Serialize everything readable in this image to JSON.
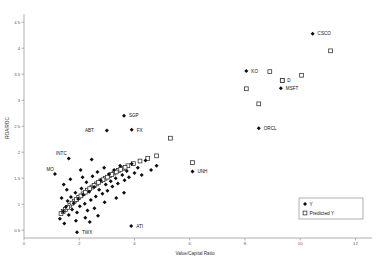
{
  "chart_data": {
    "type": "scatter",
    "title": "",
    "xlabel": "Value/Capital Ratio",
    "ylabel": "ROA/ROC",
    "xlim": [
      0,
      12.6
    ],
    "ylim": [
      0.35,
      4.62
    ],
    "xticks": [
      0,
      2,
      4,
      6,
      8,
      10,
      12
    ],
    "yticks": [
      0.5,
      1,
      1.5,
      2,
      2.5,
      3,
      3.5,
      4,
      4.5
    ],
    "grid": false,
    "legend_position": "bottom-right",
    "legend": [
      {
        "name": "Y",
        "marker": "filled-diamond",
        "color": "#0d0d0d"
      },
      {
        "name": "Predicted Y",
        "marker": "open-square",
        "color": "#2b2b2b"
      }
    ],
    "series": [
      {
        "name": "Y",
        "marker": "filled-diamond",
        "points": [
          {
            "x": 1.3,
            "y": 0.72
          },
          {
            "x": 1.42,
            "y": 0.86
          },
          {
            "x": 1.46,
            "y": 0.63
          },
          {
            "x": 1.52,
            "y": 0.95
          },
          {
            "x": 1.58,
            "y": 1.06
          },
          {
            "x": 1.62,
            "y": 0.79
          },
          {
            "x": 1.7,
            "y": 1.14
          },
          {
            "x": 1.74,
            "y": 0.9
          },
          {
            "x": 1.8,
            "y": 1.02
          },
          {
            "x": 1.86,
            "y": 1.22
          },
          {
            "x": 1.92,
            "y": 0.84
          },
          {
            "x": 1.96,
            "y": 1.1
          },
          {
            "x": 2.02,
            "y": 0.96
          },
          {
            "x": 2.08,
            "y": 1.3
          },
          {
            "x": 2.14,
            "y": 1.18
          },
          {
            "x": 2.2,
            "y": 1.01
          },
          {
            "x": 2.26,
            "y": 1.42
          },
          {
            "x": 2.3,
            "y": 0.88
          },
          {
            "x": 2.36,
            "y": 1.24
          },
          {
            "x": 2.42,
            "y": 1.08
          },
          {
            "x": 2.48,
            "y": 1.54
          },
          {
            "x": 2.54,
            "y": 1.33
          },
          {
            "x": 2.6,
            "y": 1.15
          },
          {
            "x": 2.66,
            "y": 1.62
          },
          {
            "x": 2.72,
            "y": 1.28
          },
          {
            "x": 2.78,
            "y": 1.46
          },
          {
            "x": 2.84,
            "y": 1.2
          },
          {
            "x": 2.9,
            "y": 1.7
          },
          {
            "x": 2.96,
            "y": 1.38
          },
          {
            "x": 3.02,
            "y": 1.26
          },
          {
            "x": 3.08,
            "y": 1.58
          },
          {
            "x": 3.14,
            "y": 1.44
          },
          {
            "x": 3.2,
            "y": 1.34
          },
          {
            "x": 3.26,
            "y": 1.66
          },
          {
            "x": 3.32,
            "y": 1.5
          },
          {
            "x": 3.4,
            "y": 1.4
          },
          {
            "x": 3.48,
            "y": 1.74
          },
          {
            "x": 3.56,
            "y": 1.56
          },
          {
            "x": 3.64,
            "y": 1.46
          },
          {
            "x": 3.72,
            "y": 1.64
          },
          {
            "x": 3.8,
            "y": 1.52
          },
          {
            "x": 3.9,
            "y": 1.78
          },
          {
            "x": 4.0,
            "y": 1.6
          },
          {
            "x": 4.12,
            "y": 1.7
          },
          {
            "x": 4.26,
            "y": 1.56
          },
          {
            "x": 4.4,
            "y": 1.84
          },
          {
            "x": 4.6,
            "y": 1.66
          },
          {
            "x": 4.8,
            "y": 1.74
          },
          {
            "x": 1.36,
            "y": 1.12
          },
          {
            "x": 1.55,
            "y": 1.28
          },
          {
            "x": 1.68,
            "y": 1.48
          },
          {
            "x": 2.12,
            "y": 1.52
          },
          {
            "x": 2.45,
            "y": 1.86
          },
          {
            "x": 2.05,
            "y": 1.66
          },
          {
            "x": 1.88,
            "y": 0.68
          },
          {
            "x": 2.22,
            "y": 0.74
          },
          {
            "x": 2.55,
            "y": 0.92
          },
          {
            "x": 2.92,
            "y": 1.04
          },
          {
            "x": 1.44,
            "y": 1.38
          },
          {
            "x": 3.34,
            "y": 1.12
          },
          {
            "x": 3.62,
            "y": 1.22
          },
          {
            "x": 2.68,
            "y": 0.78
          },
          {
            "x": 2.38,
            "y": 0.66
          }
        ]
      },
      {
        "name": "Predicted Y",
        "marker": "open-square",
        "points": [
          {
            "x": 1.34,
            "y": 0.82
          },
          {
            "x": 1.5,
            "y": 0.9
          },
          {
            "x": 1.66,
            "y": 0.98
          },
          {
            "x": 1.82,
            "y": 1.06
          },
          {
            "x": 1.98,
            "y": 1.13
          },
          {
            "x": 2.14,
            "y": 1.2
          },
          {
            "x": 2.3,
            "y": 1.27
          },
          {
            "x": 2.46,
            "y": 1.33
          },
          {
            "x": 2.62,
            "y": 1.39
          },
          {
            "x": 2.78,
            "y": 1.45
          },
          {
            "x": 2.94,
            "y": 1.5
          },
          {
            "x": 3.1,
            "y": 1.55
          },
          {
            "x": 3.26,
            "y": 1.6
          },
          {
            "x": 3.42,
            "y": 1.65
          },
          {
            "x": 3.58,
            "y": 1.69
          },
          {
            "x": 3.76,
            "y": 1.74
          },
          {
            "x": 3.96,
            "y": 1.78
          },
          {
            "x": 4.2,
            "y": 1.83
          },
          {
            "x": 4.48,
            "y": 1.88
          },
          {
            "x": 4.8,
            "y": 1.93
          },
          {
            "x": 1.42,
            "y": 0.86
          },
          {
            "x": 1.58,
            "y": 0.94
          },
          {
            "x": 1.74,
            "y": 1.02
          },
          {
            "x": 1.9,
            "y": 1.09
          },
          {
            "x": 2.06,
            "y": 1.16
          },
          {
            "x": 2.22,
            "y": 1.23
          },
          {
            "x": 2.38,
            "y": 1.3
          },
          {
            "x": 2.54,
            "y": 1.36
          },
          {
            "x": 2.7,
            "y": 1.42
          },
          {
            "x": 2.86,
            "y": 1.47
          },
          {
            "x": 3.02,
            "y": 1.52
          },
          {
            "x": 3.18,
            "y": 1.57
          },
          {
            "x": 3.34,
            "y": 1.62
          },
          {
            "x": 3.5,
            "y": 1.67
          },
          {
            "x": 3.66,
            "y": 1.71
          },
          {
            "x": 5.3,
            "y": 2.27
          },
          {
            "x": 8.05,
            "y": 3.22
          },
          {
            "x": 8.9,
            "y": 3.55
          },
          {
            "x": 9.35,
            "y": 3.38
          },
          {
            "x": 10.05,
            "y": 3.48
          },
          {
            "x": 11.1,
            "y": 3.95
          },
          {
            "x": 8.5,
            "y": 2.93
          },
          {
            "x": 6.1,
            "y": 1.8
          }
        ]
      }
    ],
    "labeled_points": [
      {
        "label": "CSCO",
        "x": 10.45,
        "y": 4.28,
        "series": "Y",
        "label_dx": 5,
        "label_dy": 1.5
      },
      {
        "label": "KO",
        "x": 8.05,
        "y": 3.56,
        "series": "Y",
        "label_dx": 5,
        "label_dy": 1.5
      },
      {
        "label": "MSFT",
        "x": 9.3,
        "y": 3.23,
        "series": "Y",
        "label_dx": 5,
        "label_dy": 1.5
      },
      {
        "label": "D",
        "x": 9.35,
        "y": 3.38,
        "series": "Predicted Y",
        "label_dx": 5,
        "label_dy": 1.5
      },
      {
        "label": "ORCL",
        "x": 8.5,
        "y": 2.46,
        "series": "Y",
        "label_dx": 5,
        "label_dy": 1.5
      },
      {
        "label": "SGP",
        "x": 3.62,
        "y": 2.7,
        "series": "Y",
        "label_dx": 5,
        "label_dy": 1.5
      },
      {
        "label": "ABT",
        "x": 3.0,
        "y": 2.42,
        "series": "Y",
        "label_dx": -13,
        "label_dy": 1.5
      },
      {
        "label": "FX",
        "x": 3.9,
        "y": 2.43,
        "series": "Y",
        "label_dx": 5,
        "label_dy": 2.5
      },
      {
        "label": "INTC",
        "x": 1.62,
        "y": 1.88,
        "series": "Y",
        "label_dx": -2,
        "label_dy": -3
      },
      {
        "label": "MO",
        "x": 1.12,
        "y": 1.58,
        "series": "Y",
        "label_dx": -1,
        "label_dy": -3
      },
      {
        "label": "UNH",
        "x": 6.1,
        "y": 1.63,
        "series": "Y",
        "label_dx": 5,
        "label_dy": 1.5
      },
      {
        "label": "TWX",
        "x": 1.92,
        "y": 0.46,
        "series": "Y",
        "label_dx": 5,
        "label_dy": 1.5
      },
      {
        "label": "ATI",
        "x": 3.88,
        "y": 0.58,
        "series": "Y",
        "label_dx": 5,
        "label_dy": 1.5
      }
    ]
  }
}
